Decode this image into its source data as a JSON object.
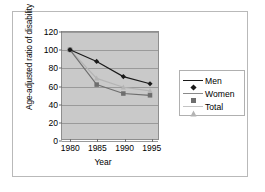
{
  "chart_data": {
    "type": "line",
    "title": "",
    "xlabel": "Year",
    "ylabel": "Age-adjusted ratio of disability",
    "x": [
      1980,
      1985,
      1990,
      1995
    ],
    "xtick_labels": [
      "1980",
      "1985",
      "1990",
      "1995"
    ],
    "ytick_labels": [
      "0",
      "20",
      "40",
      "60",
      "80",
      "100",
      "120"
    ],
    "yticks": [
      0,
      20,
      40,
      60,
      80,
      100,
      120
    ],
    "ylim": [
      0,
      120
    ],
    "xlim": [
      1978.5,
      1996.5
    ],
    "grid": "horizontal",
    "legend_position": "right",
    "plot_background": "#c9c9c9",
    "series": [
      {
        "name": "Men",
        "marker": "diamond",
        "color": "#1a1a1a",
        "values": [
          100,
          87,
          70,
          62
        ]
      },
      {
        "name": "Women",
        "marker": "square",
        "color": "#6e6e6e",
        "values": [
          100,
          61,
          51,
          49
        ]
      },
      {
        "name": "Total",
        "marker": "triangle",
        "color": "#b4b4b4",
        "values": [
          100,
          68,
          58,
          54
        ]
      }
    ]
  },
  "legend": {
    "items": [
      {
        "label": "Men"
      },
      {
        "label": "Women"
      },
      {
        "label": "Total"
      }
    ]
  },
  "axis": {
    "x_title": "Year",
    "y_title": "Age-adjusted ratio of disability"
  }
}
